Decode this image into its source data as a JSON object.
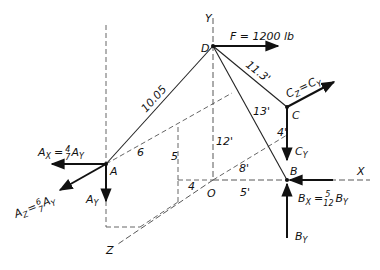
{
  "figure": {
    "axes": {
      "x": "X",
      "y": "Y",
      "z": "Z",
      "origin": "O"
    },
    "points": {
      "A": "A",
      "B": "B",
      "C": "C",
      "D": "D"
    },
    "force": {
      "label": "F = 1200 lb"
    },
    "members": {
      "AD": "10.05",
      "CD": "11.3'",
      "BD": "13'"
    },
    "dimensions": {
      "a6": "6",
      "a5": "5",
      "a4": "4",
      "oy": "12'",
      "ob": "5'",
      "ob8": "8'",
      "c4": "4'"
    },
    "reactions": {
      "Ax": {
        "main": "A",
        "sub": "X",
        "eq": "=",
        "num": "4",
        "den": "7",
        "tail": "A",
        "tailsub": "Y"
      },
      "Az": {
        "main": "A",
        "sub": "Z",
        "eq": "=",
        "num": "6",
        "den": "7",
        "tail": "A",
        "tailsub": "Y"
      },
      "Ay": {
        "main": "A",
        "sub": "Y"
      },
      "Cz": {
        "main": "C",
        "sub": "Z",
        "eq": "=",
        "tail": "C",
        "tailsub": "Y"
      },
      "Cy": {
        "main": "C",
        "sub": "Y"
      },
      "Bx": {
        "main": "B",
        "sub": "X",
        "eq": "=",
        "num": "5",
        "den": "12",
        "tail": "B",
        "tailsub": "Y"
      },
      "By": {
        "main": "B",
        "sub": "Y"
      }
    }
  }
}
